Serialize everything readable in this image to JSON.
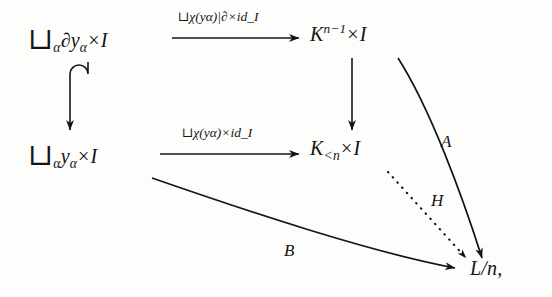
{
  "diagram": {
    "type": "commutative-diagram",
    "background_color": "#fdfdfc",
    "ink_color": "#141414",
    "nodes": [
      {
        "id": "top-left",
        "position": "top-left",
        "text": "⊔α∂yα × I",
        "latex": "\\bigsqcup_\\alpha \\partial y_\\alpha \\times I",
        "parts": {
          "operator": "⊔",
          "index": "α",
          "body": "∂y",
          "body_sub": "α",
          "times": "×",
          "factor": "I"
        }
      },
      {
        "id": "top-right",
        "position": "top-right",
        "text": "K^{n-1} × I",
        "latex": "K^{n-1} \\times I",
        "parts": {
          "base": "K",
          "exponent": "n−1",
          "times": "×",
          "factor": "I"
        }
      },
      {
        "id": "mid-left",
        "position": "middle-left",
        "text": "⊔αyα × I",
        "latex": "\\bigsqcup_\\alpha y_\\alpha \\times I",
        "parts": {
          "operator": "⊔",
          "index": "α",
          "body": "y",
          "body_sub": "α",
          "times": "×",
          "factor": "I"
        }
      },
      {
        "id": "mid-right",
        "position": "middle-right",
        "text": "K_{<n} × I",
        "latex": "K_{<n} \\times I",
        "parts": {
          "base": "K",
          "subscript": "<n",
          "times": "×",
          "factor": "I"
        }
      },
      {
        "id": "bot-right",
        "position": "bottom-right",
        "text": "L/n,",
        "latex": "L/n,",
        "parts": {
          "numerator": "L",
          "slash": "/",
          "denominator": "n",
          "punctuation": ","
        }
      }
    ],
    "edges": [
      {
        "id": "top-horizontal",
        "from": "top-left",
        "to": "top-right",
        "style": "solid-straight",
        "arrowhead": "standard",
        "label": "⊔χ(yα)|∂ × id_I",
        "label_latex": "\\sqcup\\chi(y_\\alpha)|_\\partial \\times \\mathrm{id}_I",
        "label_position": "above"
      },
      {
        "id": "left-vertical",
        "from": "top-left",
        "to": "mid-left",
        "style": "solid-hooked-inclusion",
        "arrowhead": "standard",
        "label": "",
        "label_position": "none"
      },
      {
        "id": "middle-horizontal",
        "from": "mid-left",
        "to": "mid-right",
        "style": "solid-straight",
        "arrowhead": "standard",
        "label": "⊔χ(yα) × id_I",
        "label_latex": "\\sqcup\\chi(y_\\alpha) \\times \\mathrm{id}_I",
        "label_position": "above"
      },
      {
        "id": "right-vertical",
        "from": "top-right",
        "to": "mid-right",
        "style": "solid-straight",
        "arrowhead": "standard",
        "label": "",
        "label_position": "none"
      },
      {
        "id": "curve-a",
        "from": "top-right",
        "to": "bot-right",
        "style": "solid-curved",
        "arrowhead": "standard",
        "label": "A",
        "label_latex": "A",
        "label_position": "right-of-curve"
      },
      {
        "id": "dotted-h",
        "from": "mid-right",
        "to": "bot-right",
        "style": "dotted-straight",
        "arrowhead": "standard",
        "label": "H",
        "label_latex": "H",
        "label_position": "above-right"
      },
      {
        "id": "curve-b",
        "from": "mid-left",
        "to": "bot-right",
        "style": "solid-curved",
        "arrowhead": "standard",
        "label": "B",
        "label_latex": "B",
        "label_position": "below"
      }
    ],
    "labels": {
      "top_arrow": "⊔χ(yα)|∂×id_I",
      "mid_arrow": "⊔χ(yα)×id_I",
      "a": "A",
      "h": "H",
      "b": "B"
    },
    "glyphs": {
      "sqcup": "⊔",
      "alpha": "α",
      "chi": "χ",
      "partial": "∂",
      "times": "×",
      "id": "id",
      "lt": "<"
    },
    "node_text": {
      "top_left_op": "⊔",
      "top_left_idx": "α",
      "top_left_partial": "∂",
      "top_left_y": "y",
      "top_left_ysub": "α",
      "times": "×",
      "I": "I",
      "K": "K",
      "exp_n_minus_1": "n−1",
      "sub_lt_n": "<n",
      "mid_left_op": "⊔",
      "mid_left_idx": "α",
      "mid_left_y": "y",
      "mid_left_ysub": "α",
      "L_over_n": "L/n,"
    }
  }
}
